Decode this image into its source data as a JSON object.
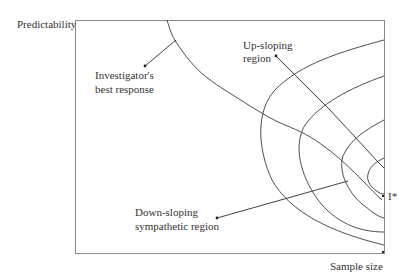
{
  "diagram": {
    "y_axis_label": "Predictability",
    "x_axis_label": "Sample size",
    "annotations": {
      "best_response": [
        "Investigator's",
        "best response"
      ],
      "up_sloping": [
        "Up-sloping",
        "region"
      ],
      "down_sloping": [
        "Down-sloping",
        "sympathetic region"
      ],
      "optimum": "I*"
    },
    "elements": {
      "curves": [
        "investigator-best-response-curve",
        "indifference-contour-1",
        "indifference-contour-2",
        "indifference-contour-3",
        "indifference-contour-4",
        "up-sloping-divider-line"
      ],
      "contour_count": 4
    }
  }
}
